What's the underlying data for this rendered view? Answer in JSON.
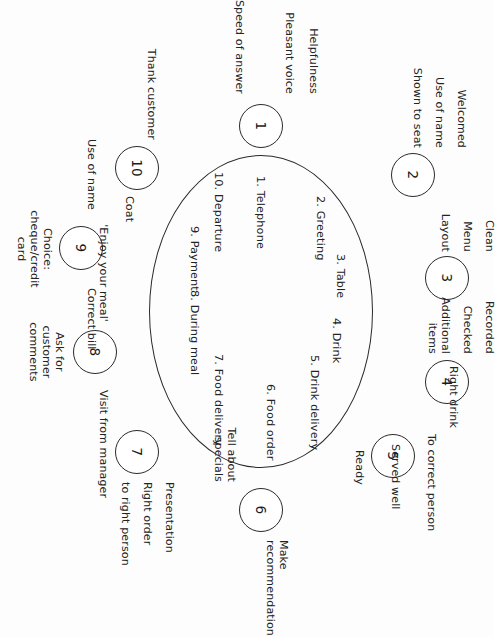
{
  "diagram": {
    "type": "cycle",
    "title": "",
    "orientation": "rotated-90-clockwise",
    "stages": [
      {
        "number": "1",
        "stage_label": "1. Telephone",
        "details": [
          "Speed of answer",
          "Pleasant voice",
          "Helpfulness"
        ]
      },
      {
        "number": "2",
        "stage_label": "2. Greeting",
        "details": [
          "Welcomed",
          "Use of name",
          "Shown to seat"
        ]
      },
      {
        "number": "3",
        "stage_label": "3. Table",
        "details": [
          "Clean",
          "Menu",
          "Layout"
        ]
      },
      {
        "number": "4",
        "stage_label": "4. Drink",
        "details": [
          "Recorded",
          "Checked",
          "Additional items"
        ]
      },
      {
        "number": "5",
        "stage_label": "5. Drink delivery",
        "details": [
          "Right drink",
          "To correct person",
          "Served well",
          "Ready"
        ]
      },
      {
        "number": "6",
        "stage_label": "6. Food order",
        "details": [
          "Make recommendation",
          "Tell about specials"
        ]
      },
      {
        "number": "7",
        "stage_label": "7. Food delivery",
        "details": [
          "Presentation",
          "Right order",
          "to right person"
        ]
      },
      {
        "number": "8",
        "stage_label": "8. During meal",
        "details": [
          "'Enjoy your meal'",
          "Ask for customer comments",
          "Visit from manager"
        ]
      },
      {
        "number": "9",
        "stage_label": "9. Payment",
        "details": [
          "Use of name",
          "Choice: cheque/credit card",
          "Correct bill"
        ]
      },
      {
        "number": "10",
        "stage_label": "10. Departure",
        "details": [
          "Thank customer",
          "Coat"
        ]
      }
    ]
  },
  "nodes": {
    "n1": "1",
    "n2": "2",
    "n3": "3",
    "n4": "4",
    "n5": "5",
    "n6": "6",
    "n7": "7",
    "n8": "8",
    "n9": "9",
    "n10": "10"
  },
  "stage_labels": {
    "s1": "1. Telephone",
    "s2": "2. Greeting",
    "s3": "3. Table",
    "s4": "4. Drink",
    "s5": "5. Drink delivery",
    "s6": "6. Food order",
    "s7": "7. Food delivery",
    "s8": "8. During meal",
    "s9": "9. Payment",
    "s10": "10. Departure"
  },
  "details": {
    "d1a": "Speed of answer",
    "d1b": "Pleasant voice",
    "d1c": "Helpfulness",
    "d2a": "Welcomed",
    "d2b": "Use of name",
    "d2c": "Shown to seat",
    "d3a": "Clean",
    "d3b": "Menu",
    "d3c": "Layout",
    "d4a": "Recorded",
    "d4b": "Checked",
    "d4c": "Additional\nitems",
    "d5a": "Right drink",
    "d5b": "To correct person",
    "d5c": "Served well",
    "d5d": "Ready",
    "d6a": "Make\nrecommendation",
    "d6b": "Tell about\nspecials",
    "d7a": "Presentation",
    "d7b": "Right order",
    "d7c": "to right person",
    "d8a": "'Enjoy your meal'",
    "d8b": "Ask for\ncustomer\ncomments",
    "d8c": "Visit from manager",
    "d9a": "Use of name",
    "d9b": "Choice:\ncheque/credit\ncard",
    "d9c": "Correct bill",
    "d10a": "Thank customer",
    "d10b": "Coat"
  },
  "colors": {
    "stroke": "#2a2a2a",
    "text": "#232323",
    "background": "#fdfdfd"
  }
}
